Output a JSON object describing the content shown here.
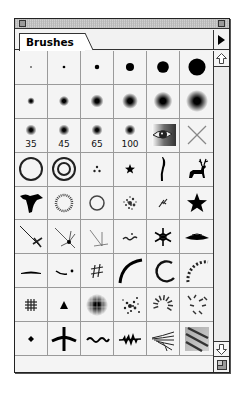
{
  "window": {
    "tab_label": "Brushes",
    "close_box": "close-box",
    "zoom_box": "zoom-box",
    "menu_icon": "triangle-right"
  },
  "brushes": {
    "rows": [
      [
        {
          "type": "hard",
          "size": 1
        },
        {
          "type": "hard",
          "size": 3
        },
        {
          "type": "hard",
          "size": 5
        },
        {
          "type": "hard",
          "size": 9
        },
        {
          "type": "hard",
          "size": 13
        },
        {
          "type": "hard",
          "size": 19
        }
      ],
      [
        {
          "type": "soft",
          "size": 5
        },
        {
          "type": "soft",
          "size": 9
        },
        {
          "type": "soft",
          "size": 13
        },
        {
          "type": "soft",
          "size": 17
        },
        {
          "type": "soft",
          "size": 21
        },
        {
          "type": "soft",
          "size": 27
        }
      ],
      [
        {
          "type": "soft",
          "size": 35,
          "label": "35"
        },
        {
          "type": "soft",
          "size": 45,
          "label": "45"
        },
        {
          "type": "soft",
          "size": 65,
          "label": "65"
        },
        {
          "type": "soft",
          "size": 100,
          "label": "100"
        },
        {
          "type": "eye"
        },
        {
          "type": "cross"
        }
      ],
      [
        {
          "type": "ring"
        },
        {
          "type": "double-ring"
        },
        {
          "type": "three-dots"
        },
        {
          "type": "small-star"
        },
        {
          "type": "calligraphic-stroke"
        },
        {
          "type": "deer"
        }
      ],
      [
        {
          "type": "bird-silhouette"
        },
        {
          "type": "dotted-ring"
        },
        {
          "type": "thin-ring"
        },
        {
          "type": "splatter"
        },
        {
          "type": "scribble"
        },
        {
          "type": "star"
        }
      ],
      [
        {
          "type": "crossed-streak"
        },
        {
          "type": "starburst"
        },
        {
          "type": "sparkle-streak"
        },
        {
          "type": "squiggle"
        },
        {
          "type": "snowflake"
        },
        {
          "type": "lens-shape"
        }
      ],
      [
        {
          "type": "dash"
        },
        {
          "type": "dash-dot"
        },
        {
          "type": "hash"
        },
        {
          "type": "arc"
        },
        {
          "type": "open-circle"
        },
        {
          "type": "dashed-arc"
        }
      ],
      [
        {
          "type": "grid-blot"
        },
        {
          "type": "triangle"
        },
        {
          "type": "soft-grid"
        },
        {
          "type": "dot-scatter"
        },
        {
          "type": "radial-dashes"
        },
        {
          "type": "leaf-scatter"
        }
      ],
      [
        {
          "type": "diamond"
        },
        {
          "type": "tree-branch"
        },
        {
          "type": "wave"
        },
        {
          "type": "leaf-spray"
        },
        {
          "type": "grass-lines"
        },
        {
          "type": "textured-stripes"
        }
      ]
    ]
  },
  "scrollbar": {
    "up_icon": "arrow-up-outline",
    "down_icon": "arrow-down-outline"
  },
  "colors": {
    "border": "#222222",
    "panel": "#f2f2f2",
    "grid_line": "#9a9a9a",
    "ink": "#000000"
  }
}
